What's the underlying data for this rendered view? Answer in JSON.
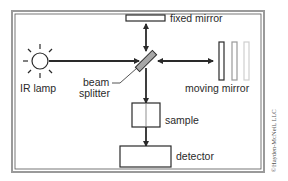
{
  "diagram": {
    "labels": {
      "fixed_mirror": "fixed mirror",
      "moving_mirror": "moving mirror",
      "ir_lamp": "IR lamp",
      "beam_line1": "beam",
      "beam_line2": "splitter",
      "sample": "sample",
      "detector": "detector"
    },
    "copyright": "©Hayden-McNeil, LLC",
    "colors": {
      "stroke": "#2a2a2a",
      "splitter_fill": "#a8a8a8",
      "frame_outer": "#9a9a9a",
      "ghost_mirror_1": "#9a9a9a",
      "ghost_mirror_2": "#cfcfcf"
    },
    "icons": [
      "sun-icon",
      "arrow-icon"
    ]
  }
}
